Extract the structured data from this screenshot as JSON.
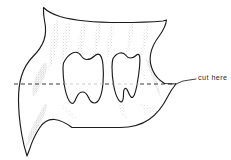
{
  "figure": {
    "type": "scientific-line-illustration",
    "canvas": {
      "width": 231,
      "height": 160
    },
    "colors": {
      "background": "#ffffff",
      "outline": "#1c1c1c",
      "cavity_outline": "#1c1c1c",
      "stipple": "#a8a49f",
      "dashed_line": "#3a3a3a",
      "leader_line": "#3a3a3a",
      "label_text": "#2b2b2b"
    },
    "outline": {
      "name": "specimen-outline",
      "stroke_width": 1.1,
      "fill": "#ffffff"
    },
    "cavities": [
      {
        "name": "cavity-left",
        "label": "left foramen"
      },
      {
        "name": "cavity-right",
        "label": "right foramen"
      }
    ],
    "cut_line": {
      "name": "cut-line",
      "style": "dashed",
      "dash_pattern": "4 3",
      "y": 84,
      "x_start": 14,
      "x_end": 176
    },
    "annotation": {
      "label": "cut here",
      "leader_from_x": 176,
      "leader_from_y": 84,
      "leader_to_x": 196,
      "leader_to_y": 80,
      "label_x": 198,
      "label_y": 76
    },
    "shading": {
      "style": "stipple",
      "description": "gray stippled streaks radiating from the dorsal margin and along lateral edges"
    }
  }
}
